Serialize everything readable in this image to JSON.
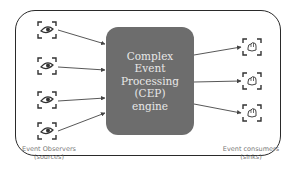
{
  "diagram": {
    "center": {
      "label": "Complex\nEvent\nProcessing\n(CEP)\nengine",
      "fill": "#6d6d6d"
    },
    "sources": {
      "caption_line1": "Event Observers",
      "caption_line2": "(sources)",
      "icon": "eye-icon",
      "count": 4
    },
    "sinks": {
      "caption_line1": "Event consumers",
      "caption_line2": "(sinks)",
      "icon": "hand-icon",
      "count": 3
    },
    "colors": {
      "border": "#2a2a2a",
      "arrow": "#444444",
      "caption": "#777777"
    }
  }
}
